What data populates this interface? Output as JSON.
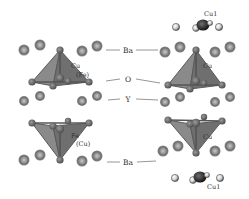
{
  "figure": {
    "colors": {
      "background": "#ffffff",
      "polyhedron_fill": "#7d7d7d",
      "polyhedron_edge": "#5a5a5a",
      "ba_atom": "#8f8f8f",
      "o_atom": "#6a6a6a",
      "y_atom": "#7a7a7a",
      "cu1_dark_atom": "#2a2a2a",
      "cu1_light_atom": "#d8d8d8",
      "leader_line": "#888888",
      "label_text": "#333333"
    }
  },
  "center_labels": {
    "ba_top": "Ba",
    "o": "O",
    "y": "Y",
    "ba_bottom": "Ba"
  },
  "polyhedra": [
    {
      "id": "upper-left",
      "site": "Cu",
      "alt_site": "(Fe)"
    },
    {
      "id": "upper-right",
      "site": "Cu",
      "alt_site": ""
    },
    {
      "id": "lower-left",
      "site": "Fe",
      "alt_site": "(Cu)"
    },
    {
      "id": "lower-right",
      "site": "Cu",
      "alt_site": ""
    }
  ],
  "chain_sites": {
    "top": "Cu1",
    "bottom": "Cu1"
  }
}
